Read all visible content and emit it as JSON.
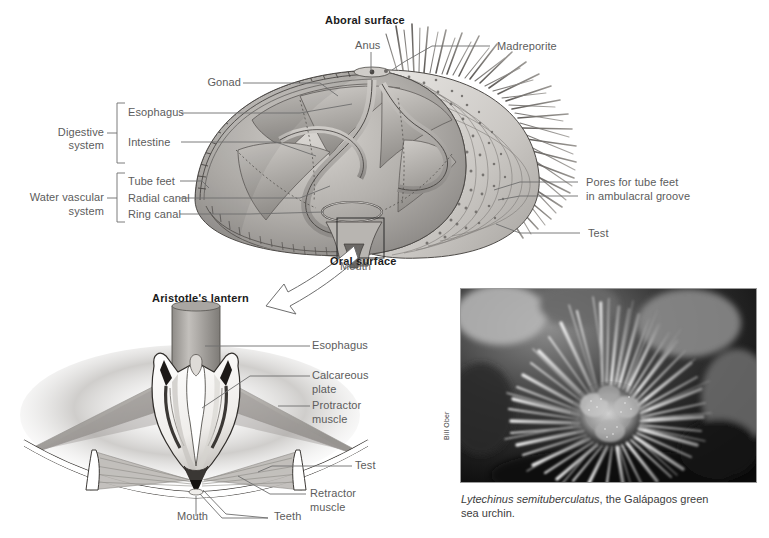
{
  "figure": {
    "title_top": "Aboral surface",
    "title_bottom": "Oral surface",
    "lantern_title": "Aristotle's lantern"
  },
  "top_diagram": {
    "headings": [
      {
        "name": "aboral-surface",
        "text": "Aboral surface"
      },
      {
        "name": "oral-surface",
        "text": "Oral surface"
      }
    ],
    "labels": [
      {
        "name": "anus",
        "text": "Anus"
      },
      {
        "name": "madreporite",
        "text": "Madreporite"
      },
      {
        "name": "gonad",
        "text": "Gonad"
      },
      {
        "name": "esophagus",
        "text": "Esophagus"
      },
      {
        "name": "intestine",
        "text": "Intestine"
      },
      {
        "name": "tube-feet",
        "text": "Tube feet"
      },
      {
        "name": "radial-canal",
        "text": "Radial canal"
      },
      {
        "name": "ring-canal",
        "text": "Ring canal"
      },
      {
        "name": "pores-line1",
        "text": "Pores for tube feet"
      },
      {
        "name": "pores-line2",
        "text": "in ambulacral groove"
      },
      {
        "name": "test",
        "text": "Test"
      },
      {
        "name": "mouth",
        "text": "Mouth"
      }
    ],
    "groups": [
      {
        "name": "digestive-system",
        "line1": "Digestive",
        "line2": "system"
      },
      {
        "name": "water-vascular-system",
        "line1": "Water vascular",
        "line2": "system"
      }
    ]
  },
  "lantern_diagram": {
    "title": "Aristotle's lantern",
    "labels": [
      {
        "name": "esophagus",
        "text": "Esophagus"
      },
      {
        "name": "calcareous-plate-line1",
        "text": "Calcareous"
      },
      {
        "name": "calcareous-plate-line2",
        "text": "plate"
      },
      {
        "name": "protractor-muscle-line1",
        "text": "Protractor"
      },
      {
        "name": "protractor-muscle-line2",
        "text": "muscle"
      },
      {
        "name": "test",
        "text": "Test"
      },
      {
        "name": "retractor-muscle-line1",
        "text": "Retractor"
      },
      {
        "name": "retractor-muscle-line2",
        "text": "muscle"
      },
      {
        "name": "mouth",
        "text": "Mouth"
      },
      {
        "name": "teeth",
        "text": "Teeth"
      }
    ]
  },
  "photo": {
    "credit": "Bill Ober",
    "caption_species": "Lytechinus semituberculatus",
    "caption_rest": ", the Galápagos green",
    "caption_line2": "sea urchin."
  },
  "colors": {
    "label_text": "#5c5c5c",
    "heading_text": "#1b1b1b",
    "leader_line": "#6e6e6e",
    "background": "#ffffff",
    "art_mid": "#9a9a9a",
    "art_dark": "#4a4a4a",
    "art_light": "#d8d8d8"
  }
}
